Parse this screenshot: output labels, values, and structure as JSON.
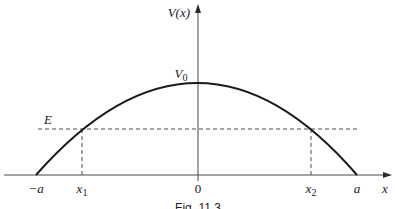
{
  "figure": {
    "caption": "Fig. 11.3",
    "y_axis_label": "V(x)",
    "x_axis_label": "x",
    "peak_label": "V",
    "peak_label_sub": "0",
    "energy_label": "E",
    "x_ticks": {
      "neg_a": "−a",
      "x1": "x",
      "x1_sub": "1",
      "zero": "0",
      "x2": "x",
      "x2_sub": "2",
      "a": "a"
    }
  },
  "colors": {
    "curve": "#1a1a1a",
    "axis": "#3a3a3a",
    "dashed": "#3a3a3a",
    "background": "#ffffff"
  }
}
